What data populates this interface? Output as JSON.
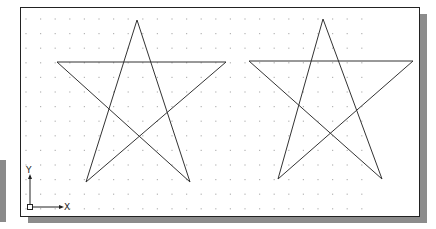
{
  "viewport": {
    "background": "#ffffff",
    "border_color": "#222222",
    "shadow_color": "#8c8c8c"
  },
  "grid": {
    "dot_color": "#b5b5b5",
    "x_start": 26,
    "x_end": 369,
    "y_start": 19,
    "y_end": 209,
    "spacing_x": 14.6,
    "spacing_y": 14.6
  },
  "shapes": [
    {
      "name": "star-left",
      "stroke": "#333333",
      "points": [
        [
          137,
          20
        ],
        [
          190,
          182
        ],
        [
          57,
          62
        ],
        [
          226,
          62
        ],
        [
          86,
          182
        ]
      ]
    },
    {
      "name": "star-right",
      "stroke": "#333333",
      "points": [
        [
          323,
          19
        ],
        [
          382,
          179
        ],
        [
          249,
          61
        ],
        [
          413,
          61
        ],
        [
          278,
          179
        ]
      ]
    }
  ],
  "ucs_icon": {
    "x_label": "X",
    "y_label": "Y",
    "origin": [
      30,
      207
    ],
    "x_axis_end": [
      62,
      207
    ],
    "y_axis_end": [
      30,
      176
    ]
  }
}
